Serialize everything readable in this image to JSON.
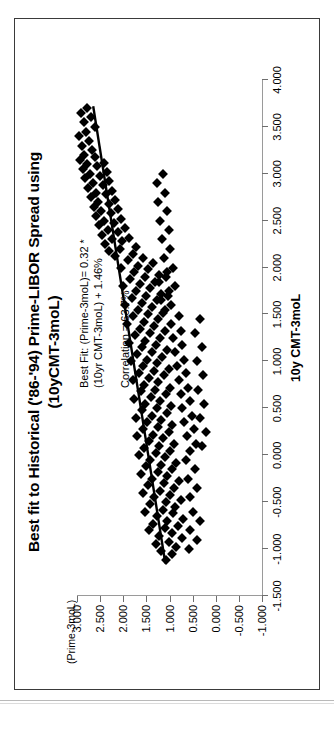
{
  "title": {
    "line1": "Best fit to Historical ('86-'94) Prime-LIBOR Spread using",
    "line2": "(10yCMT-3moL)"
  },
  "annotation": {
    "line1": "Best Fit: (Prime-3moL)= 0.32 *",
    "line2": "(10yr CMT-3moL) + 1.46%",
    "line3": "Correlation = 63.7%"
  },
  "axes": {
    "x_title": "10y CMT-3moL",
    "y_title": "(Prime-3moL)",
    "x_ticklabels": [
      "-1.500",
      "-1.000",
      "-0.500",
      "0.000",
      "0.500",
      "1.000",
      "1.500",
      "2.000",
      "2.500",
      "3.000",
      "3.500",
      "4.000"
    ],
    "y_ticklabels": [
      "-1.000",
      "-0.500",
      "0.000",
      "0.500",
      "1.000",
      "1.500",
      "2.000",
      "2.500",
      "3.000"
    ]
  },
  "colors": {
    "marker": "#000000",
    "axis": "#9a9a9a",
    "frame": "#3a3a3a",
    "background": "#ffffff"
  },
  "chart_data": {
    "type": "scatter",
    "title": "Best fit to Historical ('86-'94) Prime-LIBOR Spread using (10yCMT-3moL)",
    "xlabel": "10y CMT-3moL",
    "ylabel": "(Prime-3moL)",
    "xlim": [
      -1.5,
      4.0
    ],
    "ylim": [
      -1.0,
      3.0
    ],
    "xticks": [
      -1.5,
      -1.0,
      -0.5,
      0.0,
      0.5,
      1.0,
      1.5,
      2.0,
      2.5,
      3.0,
      3.5,
      4.0
    ],
    "yticks": [
      -1.0,
      -0.5,
      0.0,
      0.5,
      1.0,
      1.5,
      2.0,
      2.5,
      3.0
    ],
    "grid": false,
    "legend": null,
    "fit": {
      "slope": 0.32,
      "intercept": 1.46,
      "equation": "(Prime-3moL) = 0.32 * (10yr CMT-3moL) + 1.46%",
      "correlation_pct": 63.7,
      "line_endpoints": [
        [
          -1.15,
          1.09
        ],
        [
          3.72,
          2.65
        ]
      ]
    },
    "series": [
      {
        "name": "Prime-LIBOR spread vs 10yCMT-3moL",
        "marker": "diamond",
        "color": "#000000",
        "points": [
          [
            -1.12,
            1.08
          ],
          [
            -1.05,
            0.95
          ],
          [
            -1.02,
            1.18
          ],
          [
            -0.98,
            0.86
          ],
          [
            -0.95,
            1.3
          ],
          [
            -0.92,
            1.02
          ],
          [
            -0.88,
            0.74
          ],
          [
            -0.86,
            1.22
          ],
          [
            -0.83,
            0.95
          ],
          [
            -0.8,
            1.45
          ],
          [
            -0.78,
            1.1
          ],
          [
            -0.75,
            0.82
          ],
          [
            -0.73,
            1.35
          ],
          [
            -0.7,
            1.05
          ],
          [
            -0.68,
            0.7
          ],
          [
            -0.65,
            1.28
          ],
          [
            -0.62,
            0.92
          ],
          [
            -0.6,
            1.52
          ],
          [
            -0.58,
            1.15
          ],
          [
            -0.55,
            0.88
          ],
          [
            -0.52,
            1.42
          ],
          [
            -0.5,
            1.08
          ],
          [
            -0.48,
            0.76
          ],
          [
            -0.45,
            1.33
          ],
          [
            -0.42,
            1.0
          ],
          [
            -0.4,
            1.58
          ],
          [
            -0.38,
            1.2
          ],
          [
            -0.35,
            0.9
          ],
          [
            -0.32,
            1.47
          ],
          [
            -0.3,
            1.12
          ],
          [
            -0.28,
            0.8
          ],
          [
            -0.25,
            1.38
          ],
          [
            -0.22,
            1.05
          ],
          [
            -0.2,
            1.62
          ],
          [
            -0.18,
            1.25
          ],
          [
            -0.15,
            0.95
          ],
          [
            -0.12,
            1.5
          ],
          [
            -0.1,
            1.18
          ],
          [
            -0.08,
            0.85
          ],
          [
            -0.05,
            1.42
          ],
          [
            -0.02,
            1.1
          ],
          [
            0.0,
            1.66
          ],
          [
            0.02,
            1.3
          ],
          [
            0.05,
            0.98
          ],
          [
            0.08,
            1.55
          ],
          [
            0.1,
            1.22
          ],
          [
            0.12,
            0.9
          ],
          [
            0.15,
            1.45
          ],
          [
            0.18,
            1.14
          ],
          [
            0.2,
            1.7
          ],
          [
            0.22,
            1.35
          ],
          [
            0.25,
            1.02
          ],
          [
            0.28,
            1.58
          ],
          [
            0.3,
            1.26
          ],
          [
            0.32,
            0.94
          ],
          [
            0.35,
            1.48
          ],
          [
            0.38,
            1.18
          ],
          [
            0.4,
            1.72
          ],
          [
            0.42,
            1.38
          ],
          [
            0.45,
            1.06
          ],
          [
            0.48,
            1.6
          ],
          [
            0.5,
            1.28
          ],
          [
            0.52,
            0.96
          ],
          [
            0.55,
            1.52
          ],
          [
            0.58,
            1.2
          ],
          [
            0.6,
            1.76
          ],
          [
            0.62,
            1.4
          ],
          [
            0.65,
            1.08
          ],
          [
            0.68,
            1.62
          ],
          [
            0.7,
            1.32
          ],
          [
            0.72,
            1.0
          ],
          [
            0.75,
            1.55
          ],
          [
            0.78,
            1.24
          ],
          [
            0.8,
            1.8
          ],
          [
            0.82,
            1.44
          ],
          [
            0.85,
            1.12
          ],
          [
            0.88,
            1.66
          ],
          [
            0.9,
            1.34
          ],
          [
            0.92,
            1.02
          ],
          [
            0.95,
            1.58
          ],
          [
            0.98,
            1.28
          ],
          [
            1.0,
            1.84
          ],
          [
            1.02,
            1.48
          ],
          [
            1.05,
            1.16
          ],
          [
            1.08,
            1.7
          ],
          [
            1.1,
            1.38
          ],
          [
            1.12,
            1.06
          ],
          [
            1.15,
            1.6
          ],
          [
            1.18,
            1.3
          ],
          [
            1.2,
            1.88
          ],
          [
            1.22,
            1.52
          ],
          [
            1.25,
            1.2
          ],
          [
            1.28,
            1.74
          ],
          [
            1.3,
            1.42
          ],
          [
            1.32,
            1.1
          ],
          [
            1.35,
            1.64
          ],
          [
            1.38,
            1.34
          ],
          [
            1.4,
            1.92
          ],
          [
            1.42,
            1.56
          ],
          [
            1.45,
            1.24
          ],
          [
            1.48,
            1.78
          ],
          [
            1.5,
            1.46
          ],
          [
            1.52,
            1.14
          ],
          [
            1.55,
            1.68
          ],
          [
            1.58,
            1.38
          ],
          [
            1.6,
            1.96
          ],
          [
            1.62,
            1.6
          ],
          [
            1.65,
            1.28
          ],
          [
            1.68,
            1.82
          ],
          [
            1.7,
            1.5
          ],
          [
            1.72,
            1.18
          ],
          [
            1.75,
            1.72
          ],
          [
            1.78,
            1.42
          ],
          [
            1.8,
            2.0
          ],
          [
            1.82,
            1.64
          ],
          [
            1.85,
            1.32
          ],
          [
            1.88,
            1.86
          ],
          [
            1.9,
            1.54
          ],
          [
            1.92,
            1.22
          ],
          [
            1.95,
            1.76
          ],
          [
            1.98,
            1.46
          ],
          [
            2.0,
            2.04
          ],
          [
            2.02,
            1.68
          ],
          [
            2.05,
            1.36
          ],
          [
            2.08,
            1.9
          ],
          [
            2.1,
            1.58
          ],
          [
            2.12,
            2.18
          ],
          [
            2.15,
            1.8
          ],
          [
            2.18,
            2.32
          ],
          [
            2.2,
            2.08
          ],
          [
            2.22,
            1.72
          ],
          [
            2.25,
            2.4
          ],
          [
            2.28,
            2.02
          ],
          [
            2.3,
            2.24
          ],
          [
            2.32,
            1.88
          ],
          [
            2.35,
            2.46
          ],
          [
            2.38,
            2.12
          ],
          [
            2.4,
            2.34
          ],
          [
            2.42,
            1.96
          ],
          [
            2.45,
            2.52
          ],
          [
            2.48,
            2.2
          ],
          [
            2.5,
            2.42
          ],
          [
            2.52,
            2.05
          ],
          [
            2.55,
            2.58
          ],
          [
            2.58,
            2.26
          ],
          [
            2.6,
            2.48
          ],
          [
            2.62,
            2.12
          ],
          [
            2.65,
            2.64
          ],
          [
            2.68,
            2.32
          ],
          [
            2.7,
            2.54
          ],
          [
            2.72,
            2.18
          ],
          [
            2.75,
            2.7
          ],
          [
            2.78,
            2.38
          ],
          [
            2.8,
            2.6
          ],
          [
            2.82,
            2.24
          ],
          [
            2.85,
            2.76
          ],
          [
            2.88,
            2.44
          ],
          [
            2.9,
            2.66
          ],
          [
            2.92,
            2.3
          ],
          [
            2.95,
            2.82
          ],
          [
            2.98,
            2.5
          ],
          [
            3.0,
            2.72
          ],
          [
            3.02,
            2.36
          ],
          [
            3.05,
            2.88
          ],
          [
            3.08,
            2.56
          ],
          [
            3.1,
            2.78
          ],
          [
            3.12,
            2.42
          ],
          [
            3.15,
            2.94
          ],
          [
            3.18,
            2.62
          ],
          [
            3.2,
            2.84
          ],
          [
            3.25,
            2.68
          ],
          [
            3.3,
            2.9
          ],
          [
            3.35,
            2.74
          ],
          [
            3.4,
            2.96
          ],
          [
            3.45,
            2.8
          ],
          [
            3.5,
            2.62
          ],
          [
            3.55,
            2.86
          ],
          [
            3.6,
            2.7
          ],
          [
            3.65,
            2.92
          ],
          [
            3.7,
            2.78
          ],
          [
            0.05,
            0.55
          ],
          [
            0.12,
            0.42
          ],
          [
            0.2,
            0.62
          ],
          [
            0.28,
            0.48
          ],
          [
            0.35,
            0.68
          ],
          [
            0.42,
            0.52
          ],
          [
            0.5,
            0.72
          ],
          [
            0.58,
            0.56
          ],
          [
            0.65,
            0.76
          ],
          [
            0.72,
            0.6
          ],
          [
            0.8,
            0.8
          ],
          [
            0.88,
            0.64
          ],
          [
            0.95,
            0.84
          ],
          [
            1.02,
            0.68
          ],
          [
            1.1,
            0.88
          ],
          [
            1.18,
            0.72
          ],
          [
            1.25,
            0.92
          ],
          [
            1.32,
            0.76
          ],
          [
            1.4,
            0.96
          ],
          [
            1.48,
            0.8
          ],
          [
            -0.45,
            0.55
          ],
          [
            -0.35,
            0.4
          ],
          [
            -0.25,
            0.6
          ],
          [
            -0.15,
            0.45
          ],
          [
            -0.05,
            0.65
          ],
          [
            -0.6,
            0.5
          ],
          [
            -0.7,
            0.35
          ],
          [
            -0.8,
            0.55
          ],
          [
            -0.9,
            0.4
          ],
          [
            -1.0,
            0.58
          ],
          [
            0.1,
            0.3
          ],
          [
            0.25,
            0.22
          ],
          [
            0.4,
            0.34
          ],
          [
            0.55,
            0.26
          ],
          [
            0.7,
            0.38
          ],
          [
            0.85,
            0.28
          ],
          [
            1.0,
            0.4
          ],
          [
            1.15,
            0.3
          ],
          [
            1.3,
            0.44
          ],
          [
            1.45,
            0.34
          ],
          [
            1.6,
            0.96
          ],
          [
            1.7,
            1.04
          ],
          [
            1.8,
            0.88
          ],
          [
            1.9,
            1.08
          ],
          [
            2.0,
            0.92
          ],
          [
            2.1,
            1.12
          ],
          [
            2.2,
            0.98
          ],
          [
            2.3,
            1.16
          ],
          [
            2.4,
            1.02
          ],
          [
            2.5,
            1.2
          ],
          [
            2.6,
            1.06
          ],
          [
            2.7,
            1.24
          ],
          [
            2.8,
            1.1
          ],
          [
            2.9,
            1.28
          ],
          [
            3.0,
            1.14
          ],
          [
            1.55,
            1.1
          ],
          [
            1.65,
            1.18
          ],
          [
            1.75,
            1.02
          ],
          [
            1.85,
            1.22
          ],
          [
            1.95,
            1.06
          ]
        ]
      }
    ]
  }
}
